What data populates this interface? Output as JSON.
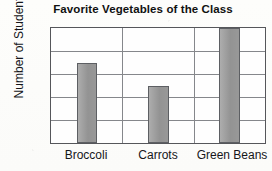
{
  "chart_data": {
    "type": "bar",
    "title": "Favorite Vegetables of the Class",
    "xlabel": "",
    "ylabel": "Number of Students",
    "categories": [
      "Broccoli",
      "Carrots",
      "Green Beans"
    ],
    "values": [
      7,
      5,
      10
    ],
    "ylim": [
      0,
      10
    ],
    "ytick_labels": [
      "2",
      "4",
      "6",
      "8",
      "10"
    ],
    "ytick_values": [
      2,
      4,
      6,
      8,
      10
    ],
    "grid": "horizontal",
    "legend": "none",
    "colors": {
      "bar_fill": "#9b9b9b",
      "bar_outline": "#5d5f63",
      "axis": "#55565a",
      "gridline": "#85878b",
      "text": "#15161a",
      "background": "#fdfdfb"
    }
  }
}
